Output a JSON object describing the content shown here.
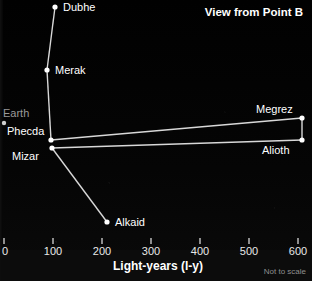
{
  "chart_data": {
    "type": "scatter",
    "title": "View from Point B",
    "xlabel": "Light-years (l-y)",
    "ylabel": "",
    "footnote": "Not to scale",
    "xlim": [
      0,
      620
    ],
    "xticks": [
      0,
      100,
      200,
      300,
      400,
      500,
      600
    ],
    "xticklabels": [
      "0",
      "100",
      "200",
      "300",
      "400",
      "500",
      "600"
    ],
    "grid": false,
    "background_color": "#000000",
    "marker_color": "#ffffff",
    "line_color": "#d8d8d8",
    "label_color": "#ffffff",
    "dim_label_color": "#9a9a9a",
    "points": [
      {
        "name": "Dubhe",
        "distance_ly": 105,
        "px": 55,
        "py": 7,
        "label": "Dubhe",
        "label_dx": 8,
        "label_dy": -5,
        "dim": false
      },
      {
        "name": "Merak",
        "distance_ly": 88,
        "px": 47,
        "py": 70,
        "label": "Merak",
        "label_dx": 8,
        "label_dy": -5,
        "dim": false
      },
      {
        "name": "Phecda",
        "distance_ly": 96,
        "px": 51,
        "py": 140,
        "label": "Phecda",
        "label_dx": -44,
        "label_dy": -14,
        "dim": false
      },
      {
        "name": "Mizar",
        "distance_ly": 98,
        "px": 52,
        "py": 148,
        "label": "Mizar",
        "label_dx": -40,
        "label_dy": 3,
        "dim": false
      },
      {
        "name": "Alkaid",
        "distance_ly": 210,
        "px": 107,
        "py": 222,
        "label": "Alkaid",
        "label_dx": 8,
        "label_dy": -5,
        "dim": false
      },
      {
        "name": "Megrez",
        "distance_ly": 610,
        "px": 302,
        "py": 118,
        "label": "Megrez",
        "label_dx": -46,
        "label_dy": -14,
        "dim": false
      },
      {
        "name": "Alioth",
        "distance_ly": 610,
        "px": 302,
        "py": 140,
        "label": "Alioth",
        "label_dx": -40,
        "label_dy": 5,
        "dim": false
      },
      {
        "name": "Earth",
        "distance_ly": 0,
        "px": 4,
        "py": 123,
        "label": "Earth",
        "label_dx": -1,
        "label_dy": -15,
        "dim": true
      }
    ],
    "connections": [
      [
        "Dubhe",
        "Merak"
      ],
      [
        "Merak",
        "Phecda"
      ],
      [
        "Phecda",
        "Megrez"
      ],
      [
        "Mizar",
        "Alioth"
      ],
      [
        "Mizar",
        "Alkaid"
      ],
      [
        "Megrez",
        "Alioth"
      ]
    ]
  }
}
